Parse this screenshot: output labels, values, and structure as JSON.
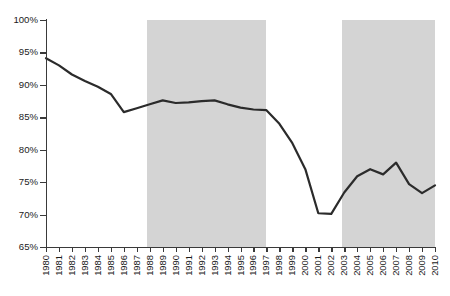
{
  "chart_data": {
    "type": "line",
    "title": "",
    "subtitle": "",
    "xlabel": "",
    "ylabel": "",
    "grid": false,
    "legend_position": "none",
    "ylim": [
      65,
      100
    ],
    "ytick_values": [
      65,
      70,
      75,
      80,
      85,
      90,
      95,
      100
    ],
    "ytick_labels": [
      "65%",
      "70%",
      "75%",
      "80%",
      "85%",
      "90%",
      "95%",
      "100%"
    ],
    "xlim": [
      1980,
      2010
    ],
    "categories": [
      "1980",
      "1981",
      "1982",
      "1983",
      "1984",
      "1985",
      "1986",
      "1987",
      "1988",
      "1989",
      "1990",
      "1991",
      "1992",
      "1993",
      "1994",
      "1995",
      "1996",
      "1997",
      "1998",
      "1999",
      "2000",
      "2001",
      "2002",
      "2003",
      "2004",
      "2005",
      "2006",
      "2007",
      "2008",
      "2009",
      "2010"
    ],
    "x": [
      1980,
      1981,
      1982,
      1983,
      1984,
      1985,
      1986,
      1987,
      1988,
      1989,
      1990,
      1991,
      1992,
      1993,
      1994,
      1995,
      1996,
      1997,
      1998,
      1999,
      2000,
      2001,
      2002,
      2003,
      2004,
      2005,
      2006,
      2007,
      2008,
      2009,
      2010
    ],
    "values": [
      94.1,
      93.0,
      91.6,
      90.6,
      89.7,
      88.6,
      85.8,
      86.4,
      87.0,
      87.6,
      87.2,
      87.3,
      87.5,
      87.6,
      87.0,
      86.5,
      86.2,
      86.1,
      84.0,
      81.0,
      77.0,
      70.2,
      70.1,
      73.4,
      75.9,
      77.0,
      76.2,
      78.0,
      74.7,
      73.3,
      74.5
    ],
    "series": [
      {
        "name": "series-1",
        "color": "#2b2b2b",
        "line_width": 2.2,
        "values": [
          94.1,
          93.0,
          91.6,
          90.6,
          89.7,
          88.6,
          85.8,
          86.4,
          87.0,
          87.6,
          87.2,
          87.3,
          87.5,
          87.6,
          87.0,
          86.5,
          86.2,
          86.1,
          84.0,
          81.0,
          77.0,
          70.2,
          70.1,
          73.4,
          75.9,
          77.0,
          76.2,
          78.0,
          74.7,
          73.3,
          74.5
        ]
      }
    ],
    "shaded_bands": [
      {
        "name": "band-1",
        "start": 1987.8,
        "end": 1997.0,
        "color": "#d4d4d4"
      },
      {
        "name": "band-2",
        "start": 2002.8,
        "end": 2010.8,
        "color": "#d4d4d4"
      }
    ],
    "colors": {
      "line": "#2b2b2b",
      "band": "#d4d4d4",
      "axis": "#3a3a3a",
      "text": "#1a1a1a",
      "background": "#ffffff"
    }
  }
}
